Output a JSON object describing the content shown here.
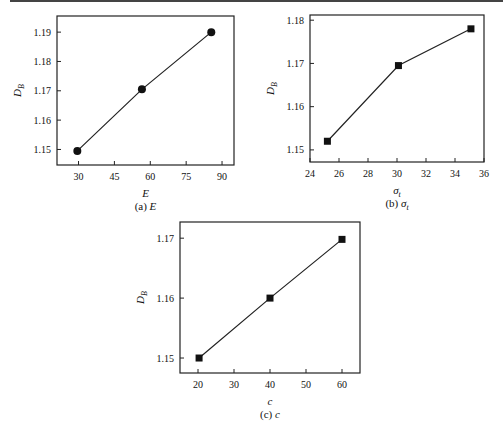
{
  "chart_data": [
    {
      "type": "line",
      "id": "a",
      "caption": "(a) E",
      "caption_prefix": "(a)",
      "caption_var": "E",
      "xlabel": "E",
      "ylabel": "D_B",
      "marker": "circle",
      "x": [
        29.5,
        56.5,
        85.5
      ],
      "y": [
        1.1495,
        1.1705,
        1.19
      ],
      "xticks": [
        30,
        45,
        60,
        75,
        90
      ],
      "yticks": [
        1.15,
        1.16,
        1.17,
        1.18,
        1.19
      ],
      "xlim": [
        21,
        95
      ],
      "ylim": [
        1.1447,
        1.1955
      ],
      "frame": {
        "left": 57,
        "right": 234,
        "top": 16,
        "bottom": 165
      },
      "grid": false
    },
    {
      "type": "line",
      "id": "b",
      "caption": "(b) σt",
      "caption_prefix": "(b)",
      "caption_var": "σ",
      "caption_sub": "t",
      "xlabel": "σt",
      "ylabel": "D_B",
      "marker": "square",
      "x": [
        25.2,
        30.1,
        35.1
      ],
      "y": [
        1.152,
        1.1695,
        1.178
      ],
      "xticks": [
        24,
        26,
        28,
        30,
        32,
        34,
        36
      ],
      "yticks": [
        1.15,
        1.16,
        1.17,
        1.18
      ],
      "xlim": [
        24,
        36
      ],
      "ylim": [
        1.1472,
        1.1812
      ],
      "frame": {
        "left": 310,
        "right": 484,
        "top": 15,
        "bottom": 162
      },
      "grid": false
    },
    {
      "type": "line",
      "id": "c",
      "caption": "(c) c",
      "caption_prefix": "(c)",
      "caption_var": "c",
      "xlabel": "c",
      "ylabel": "D_B",
      "marker": "square",
      "x": [
        20.3,
        40,
        60
      ],
      "y": [
        1.15,
        1.16,
        1.1698
      ],
      "xticks": [
        20,
        30,
        40,
        50,
        60
      ],
      "yticks": [
        1.15,
        1.16,
        1.17
      ],
      "xlim": [
        15,
        65
      ],
      "ylim": [
        1.1475,
        1.1727
      ],
      "frame": {
        "left": 180,
        "right": 360,
        "top": 222,
        "bottom": 373
      },
      "grid": false
    }
  ],
  "labels": {
    "ylabel_main": "D",
    "ylabel_sub": "B"
  }
}
